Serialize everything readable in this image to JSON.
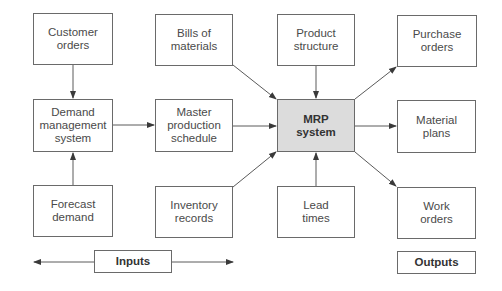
{
  "diagram": {
    "colors": {
      "mrp_fill": "#dcdcdc",
      "border": "#6a6a6a",
      "arrow": "#3a3a3a"
    },
    "boxes": {
      "customer_orders": "Customer\norders",
      "demand_management": "Demand\nmanagement\nsystem",
      "forecast_demand": "Forecast\ndemand",
      "bills_of_materials": "Bills of\nmaterials",
      "master_production_schedule": "Master\nproduction\nschedule",
      "inventory_records": "Inventory\nrecords",
      "product_structure": "Product\nstructure",
      "mrp_system": "MRP\nsystem",
      "lead_times": "Lead\ntimes",
      "purchase_orders": "Purchase\norders",
      "material_plans": "Material\nplans",
      "work_orders": "Work\norders"
    },
    "legend": {
      "inputs": "Inputs",
      "outputs": "Outputs"
    },
    "edges": [
      {
        "from": "Customer orders",
        "to": "Demand management system"
      },
      {
        "from": "Forecast demand",
        "to": "Demand management system"
      },
      {
        "from": "Demand management system",
        "to": "Master production schedule"
      },
      {
        "from": "Master production schedule",
        "to": "MRP system"
      },
      {
        "from": "Bills of materials",
        "to": "MRP system"
      },
      {
        "from": "Product structure",
        "to": "MRP system"
      },
      {
        "from": "Inventory records",
        "to": "MRP system"
      },
      {
        "from": "Lead times",
        "to": "MRP system"
      },
      {
        "from": "MRP system",
        "to": "Purchase orders"
      },
      {
        "from": "MRP system",
        "to": "Material plans"
      },
      {
        "from": "MRP system",
        "to": "Work orders"
      }
    ]
  }
}
